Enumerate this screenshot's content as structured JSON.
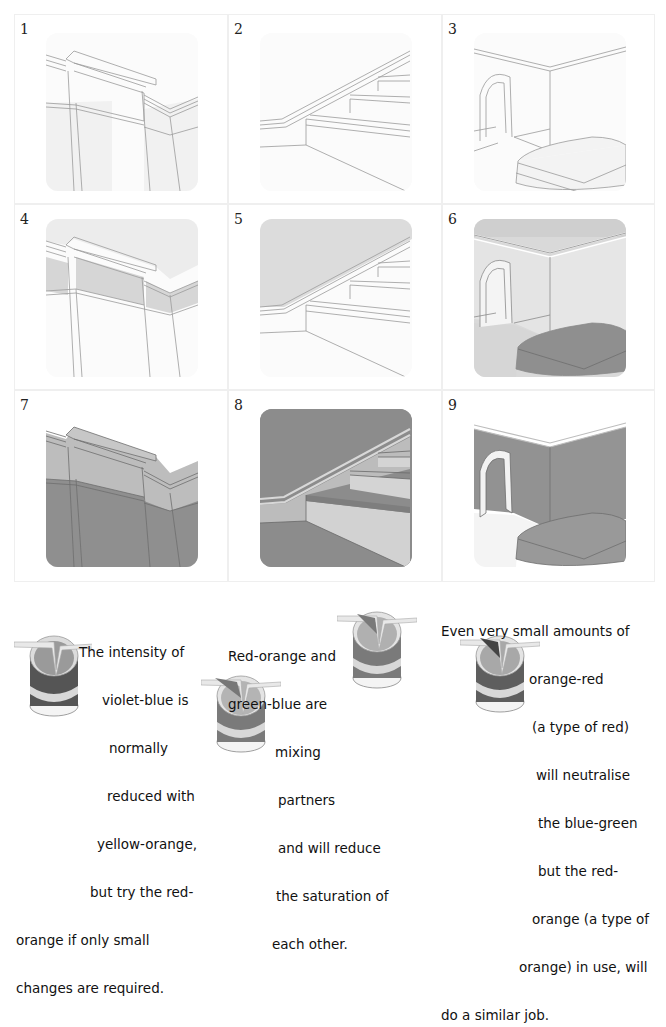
{
  "panels": [
    {
      "number": "1",
      "scene": "cornice-wall",
      "shading": "none"
    },
    {
      "number": "2",
      "scene": "staircase",
      "shading": "none"
    },
    {
      "number": "3",
      "scene": "room-with-arch-and-bed",
      "shading": "none"
    },
    {
      "number": "4",
      "scene": "cornice-wall",
      "shading": "frieze-light"
    },
    {
      "number": "5",
      "scene": "staircase",
      "shading": "upper-wall-light"
    },
    {
      "number": "6",
      "scene": "room-with-arch-and-bed",
      "shading": "walls-light-bed-dark"
    },
    {
      "number": "7",
      "scene": "cornice-wall",
      "shading": "walls-dark"
    },
    {
      "number": "8",
      "scene": "staircase",
      "shading": "walls-dark"
    },
    {
      "number": "9",
      "scene": "room-with-arch-and-bed",
      "shading": "walls-dark"
    }
  ],
  "captions": [
    {
      "id": "violet-blue-note",
      "lines": [
        "The intensity of",
        "violet-blue is",
        "normally",
        "reduced with",
        "yellow-orange,",
        "but try the red-",
        "orange if only small",
        "changes are required."
      ]
    },
    {
      "id": "mixing-partners-note",
      "lines": [
        "Red-orange and",
        "green-blue are",
        "mixing",
        "partners",
        "and will reduce",
        "the saturation of",
        "each other."
      ]
    },
    {
      "id": "neutralise-note",
      "lines": [
        "Even very small amounts of",
        "orange-red",
        "(a type of red)",
        "will neutralise",
        "the blue-green",
        "but the red-",
        "orange (a type of",
        "orange) in use, will",
        "do a similar job."
      ]
    }
  ],
  "icons": [
    "paint-can-icon",
    "paint-can-icon",
    "paint-can-icon",
    "paint-can-icon"
  ],
  "colors": {
    "line": "#9a9a9a",
    "light_fill": "#e2e2e2",
    "mid_fill": "#cfcfcf",
    "dark_fill": "#8f8f8f",
    "cell_border": "#efefef"
  }
}
